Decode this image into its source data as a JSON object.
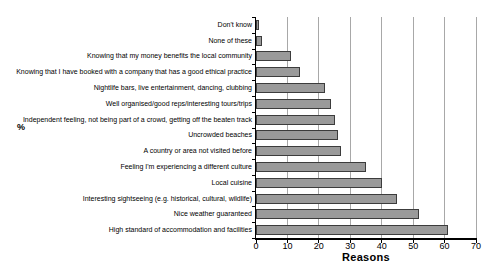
{
  "chart_data": {
    "type": "bar",
    "orientation": "horizontal",
    "title": "",
    "xlabel": "Reasons",
    "ylabel": "%",
    "xlim": [
      0,
      70
    ],
    "xticks": [
      0,
      10,
      20,
      30,
      40,
      50,
      60,
      70
    ],
    "grid": true,
    "legend": false,
    "categories": [
      "Don't know",
      "None of these",
      "Knowing that my money benefits the local community",
      "Knowing that I have booked with a company that has a good ethical practice",
      "Nightlife bars, live entertainment, dancing, clubbing",
      "Well organised/good reps/interesting tours/trips",
      "Independent feeling, not being part of a crowd, getting off the beaten track",
      "Uncrowded beaches",
      "A country or area not visited before",
      "Feeling I'm experiencing a different culture",
      "Local cuisine",
      "Interesting sightseeing (e.g. historical, cultural, wildlife)",
      "Nice weather guaranteed",
      "High standard of accommodation and facilities"
    ],
    "values": [
      1,
      2,
      11,
      14,
      22,
      24,
      25,
      26,
      27,
      35,
      40,
      45,
      52,
      61
    ],
    "colors": {
      "background": "#ffffff",
      "bar_fill": "#9a9a9a",
      "bar_border": "#3c3c3c",
      "gridline": "#a8a8a8",
      "axis": "#000000",
      "text": "#000000"
    }
  }
}
